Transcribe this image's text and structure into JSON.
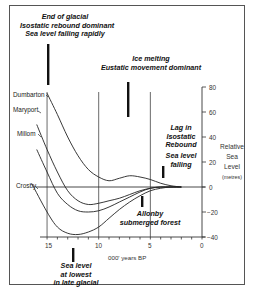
{
  "annotations": {
    "end_glacial": [
      "End of glacial",
      "Isostatic rebound dominant",
      "Sea level falling rapidly"
    ],
    "ice_melting": [
      "Ice melting",
      "Eustatic movement dominant"
    ],
    "lag_isostatic": [
      "Lag in",
      "Isostatic",
      "Rebound"
    ],
    "sea_level_falling": [
      "Sea level",
      "falling"
    ],
    "allonby": [
      "Allonby",
      "submerged forest"
    ],
    "lowest": [
      "Sea level",
      "at lowest",
      "in late glacial"
    ]
  },
  "sites": [
    "Dumbarton",
    "Maryport",
    "Millom",
    "Crosby"
  ],
  "axes": {
    "x_label": "000' years BP",
    "x_ticks": [
      "15",
      "10",
      "5",
      "0"
    ],
    "y_label": [
      "Relative",
      "Sea",
      "Level"
    ],
    "y_units": "(metres)",
    "y_ticks": [
      "80",
      "60",
      "40",
      "20",
      "0",
      "−20",
      "−40"
    ]
  },
  "chart_data": {
    "type": "line",
    "title": "",
    "xlabel": "000' years BP",
    "ylabel": "Relative Sea Level (metres)",
    "xlim": [
      16,
      0
    ],
    "ylim": [
      -40,
      80
    ],
    "x_ticks": [
      15,
      10,
      5,
      0
    ],
    "y_ticks": [
      -40,
      -20,
      0,
      20,
      40,
      60,
      80
    ],
    "grid": false,
    "vertical_reference_lines": [
      15,
      10,
      5
    ],
    "series": [
      {
        "name": "Dumbarton",
        "x": [
          15,
          14,
          13,
          12,
          11,
          10,
          9,
          8,
          7,
          6,
          5,
          4,
          3,
          2
        ],
        "y": [
          75,
          58,
          40,
          25,
          14,
          8,
          5,
          7,
          9,
          8,
          6,
          3,
          1,
          0
        ]
      },
      {
        "name": "Maryport",
        "x": [
          16,
          15,
          14,
          13,
          12,
          11,
          10,
          9,
          8,
          7,
          6,
          5,
          4,
          3,
          2
        ],
        "y": [
          50,
          30,
          12,
          -3,
          -11,
          -14,
          -13,
          -11,
          -9,
          -6,
          -3,
          -1,
          0,
          0,
          0
        ]
      },
      {
        "name": "Millom",
        "x": [
          16,
          15,
          14,
          13,
          12,
          11,
          10,
          9,
          8,
          7,
          6,
          5,
          4,
          3,
          2
        ],
        "y": [
          30,
          12,
          -5,
          -14,
          -19,
          -20,
          -19,
          -16,
          -12,
          -8,
          -4,
          -1,
          0,
          0,
          0
        ]
      },
      {
        "name": "Crosby",
        "x": [
          16.5,
          15,
          14,
          13,
          12,
          11,
          10,
          9,
          8,
          7,
          6,
          5,
          4,
          3,
          2
        ],
        "y": [
          3,
          -20,
          -32,
          -37,
          -38,
          -36,
          -32,
          -25,
          -18,
          -12,
          -7,
          -3,
          -1,
          0,
          0
        ]
      }
    ],
    "markers": [
      {
        "label": "End of glacial / Isostatic rebound dominant / Sea level falling rapidly",
        "x": 15
      },
      {
        "label": "Ice melting / Eustatic movement dominant",
        "x": 8.3
      },
      {
        "label": "Lag in Isostatic Rebound / Sea level falling",
        "x": 3.7
      },
      {
        "label": "Allonby submerged forest",
        "x": 5.9
      },
      {
        "label": "Sea level at lowest in late glacial",
        "x": 12.7
      }
    ]
  }
}
